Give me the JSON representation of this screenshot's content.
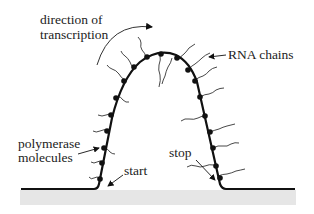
{
  "diagram": {
    "labels": {
      "direction_line1": "direction of",
      "direction_line2": "transcription",
      "rna_chains": "RNA chains",
      "polymerase_line1": "polymerase",
      "polymerase_line2": "molecules",
      "start": "start",
      "stop": "stop"
    },
    "colors": {
      "dna": "#111111",
      "rna": "#333333",
      "surface": "#e6e6e6",
      "text": "#222222"
    }
  }
}
